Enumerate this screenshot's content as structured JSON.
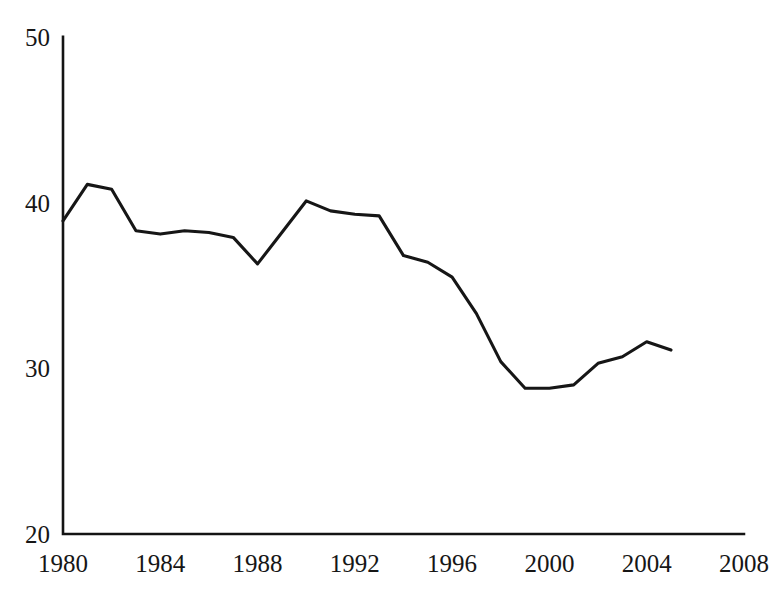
{
  "chart_data": {
    "type": "line",
    "title": "",
    "subtitle": "",
    "xlabel": "",
    "ylabel": "",
    "xlim": [
      1980,
      2008
    ],
    "ylim": [
      20,
      50
    ],
    "grid": false,
    "legend": null,
    "legend_position": "none",
    "line_color": "#161616",
    "axis_color": "#141414",
    "background_color": "#ffffff",
    "y_ticks": [
      20,
      30,
      40,
      50
    ],
    "y_tick_labels": [
      "20",
      "30",
      "40",
      "50"
    ],
    "x_ticks": [
      1980,
      1984,
      1988,
      1992,
      1996,
      2000,
      2004,
      2008
    ],
    "x_tick_labels": [
      "1980",
      "1984",
      "1988",
      "1992",
      "1996",
      "2000",
      "2004",
      "2008"
    ],
    "x": [
      1980,
      1981,
      1982,
      1983,
      1984,
      1985,
      1986,
      1987,
      1988,
      1989,
      1990,
      1991,
      1992,
      1993,
      1994,
      1995,
      1996,
      1997,
      1998,
      1999,
      2000,
      2001,
      2002,
      2003,
      2004,
      2005
    ],
    "values": [
      38.9,
      41.1,
      40.8,
      38.3,
      38.1,
      38.3,
      38.2,
      37.9,
      36.3,
      38.2,
      40.1,
      39.5,
      39.3,
      39.2,
      36.8,
      36.4,
      35.5,
      33.3,
      30.4,
      28.8,
      28.8,
      29.0,
      30.3,
      30.7,
      31.6,
      31.1
    ],
    "series": [
      {
        "name": "",
        "values": [
          38.9,
          41.1,
          40.8,
          38.3,
          38.1,
          38.3,
          38.2,
          37.9,
          36.3,
          38.2,
          40.1,
          39.5,
          39.3,
          39.2,
          36.8,
          36.4,
          35.5,
          33.3,
          30.4,
          28.8,
          28.8,
          29.0,
          30.3,
          30.7,
          31.6,
          31.1
        ]
      }
    ]
  }
}
